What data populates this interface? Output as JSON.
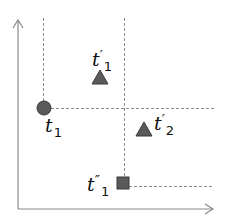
{
  "diagram": {
    "type": "dominance-plot",
    "colors": {
      "axis": "#8a8a8a",
      "dashed": "#8c8c8c",
      "marker_fill": "#5a5a5a",
      "marker_stroke": "#3a3a3a",
      "text": "#111111"
    },
    "axes": {
      "x_axis": {
        "label": ""
      },
      "y_axis": {
        "label": ""
      }
    },
    "points": [
      {
        "id": "t1",
        "shape": "circle",
        "label_base": "t",
        "label_prime": "",
        "label_sub": "1"
      },
      {
        "id": "t_prime_1",
        "shape": "triangle",
        "label_base": "t",
        "label_prime": "′",
        "label_sub": "1"
      },
      {
        "id": "t_prime_2",
        "shape": "triangle",
        "label_base": "t",
        "label_prime": "′",
        "label_sub": "2"
      },
      {
        "id": "t_double_prime_1",
        "shape": "square",
        "label_base": "t",
        "label_prime": "″",
        "label_sub": "1"
      }
    ]
  }
}
